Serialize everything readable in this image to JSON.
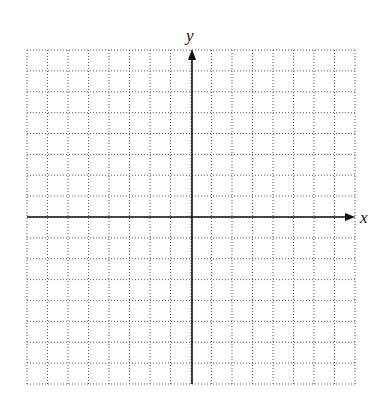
{
  "diagram": {
    "type": "coordinate-plane",
    "grid": {
      "columns": 16,
      "rows": 16,
      "left": 27,
      "top": 50,
      "right": 355,
      "bottom": 384,
      "line_style": "dotted",
      "line_color": "#555555"
    },
    "axes": {
      "color": "#111111",
      "x_axis": {
        "label": "x",
        "y_position": 217,
        "arrow": "right"
      },
      "y_axis": {
        "label": "y",
        "x_position": 192,
        "arrow": "up"
      }
    }
  }
}
